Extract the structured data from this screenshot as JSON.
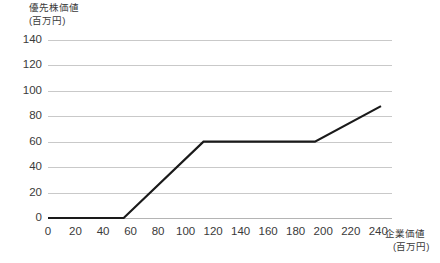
{
  "chart_data": {
    "type": "line",
    "title": "",
    "xlabel": "企業価値",
    "xlabel_unit": "(百万円)",
    "ylabel": "優先株価値",
    "ylabel_unit": "(百万円)",
    "xlim": [
      0,
      250
    ],
    "ylim": [
      0,
      140
    ],
    "xticks": [
      0,
      20,
      40,
      60,
      80,
      100,
      120,
      140,
      160,
      180,
      200,
      220,
      240
    ],
    "yticks": [
      0,
      20,
      40,
      60,
      80,
      100,
      120,
      140
    ],
    "grid": "horizontal",
    "legend": "none",
    "series": [
      {
        "name": "優先株価値",
        "color": "#1a1a1a",
        "points": [
          {
            "x": 0,
            "y": 0
          },
          {
            "x": 55,
            "y": 0
          },
          {
            "x": 113,
            "y": 60
          },
          {
            "x": 194,
            "y": 60
          },
          {
            "x": 242,
            "y": 88
          }
        ]
      }
    ]
  },
  "colors": {
    "background": "#ffffff",
    "gridline": "#c9c9c9",
    "baseline": "#b4b4b4",
    "data_line": "#1a1a1a",
    "text": "#3a3a3a"
  }
}
